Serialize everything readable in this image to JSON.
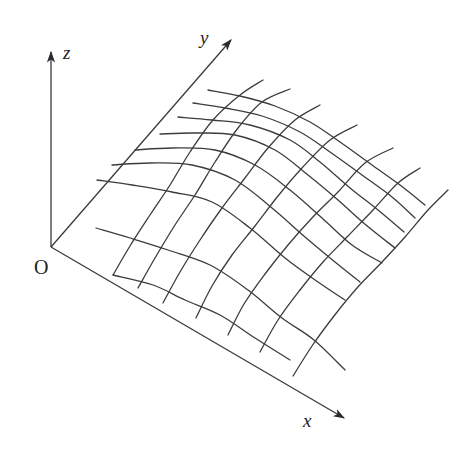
{
  "diagram": {
    "title": "",
    "axes": {
      "origin": {
        "label": "O",
        "pos": [
          51,
          247
        ],
        "label_pos": [
          34,
          257
        ]
      },
      "z": {
        "label": "z",
        "from": [
          51,
          247
        ],
        "to": [
          51,
          52
        ],
        "label_pos": [
          63,
          43
        ]
      },
      "y": {
        "label": "y",
        "from": [
          51,
          247
        ],
        "to": [
          231,
          40
        ],
        "label_pos": [
          200,
          28
        ]
      },
      "x": {
        "label": "x",
        "from": [
          51,
          247
        ],
        "to": [
          344,
          418
        ],
        "label_pos": [
          303,
          411
        ]
      }
    },
    "colors": {
      "line": "#3c3c3c",
      "axis": "#3a3a3a",
      "background": "#ffffff"
    },
    "mesh": {
      "x_lines": [
        [
          [
            208,
            90
          ],
          [
            240,
            96
          ],
          [
            275,
            106
          ],
          [
            310,
            122
          ],
          [
            340,
            142
          ],
          [
            372,
            165
          ],
          [
            400,
            185
          ],
          [
            425,
            205
          ]
        ],
        [
          [
            193,
            103
          ],
          [
            225,
            108
          ],
          [
            262,
            116
          ],
          [
            300,
            132
          ],
          [
            330,
            152
          ],
          [
            362,
            175
          ],
          [
            392,
            197
          ],
          [
            415,
            218
          ]
        ],
        [
          [
            178,
            117
          ],
          [
            212,
            120
          ],
          [
            250,
            125
          ],
          [
            290,
            140
          ],
          [
            320,
            162
          ],
          [
            350,
            188
          ],
          [
            378,
            210
          ],
          [
            404,
            232
          ]
        ],
        [
          [
            160,
            134
          ],
          [
            195,
            133
          ],
          [
            235,
            135
          ],
          [
            275,
            150
          ],
          [
            308,
            175
          ],
          [
            338,
            200
          ],
          [
            366,
            225
          ],
          [
            395,
            248
          ]
        ],
        [
          [
            135,
            150
          ],
          [
            172,
            148
          ],
          [
            215,
            150
          ],
          [
            255,
            165
          ],
          [
            290,
            190
          ],
          [
            322,
            218
          ],
          [
            352,
            245
          ],
          [
            382,
            263
          ]
        ],
        [
          [
            112,
            165
          ],
          [
            150,
            163
          ],
          [
            192,
            165
          ],
          [
            235,
            180
          ],
          [
            272,
            208
          ],
          [
            305,
            237
          ],
          [
            335,
            262
          ],
          [
            360,
            282
          ]
        ],
        [
          [
            97,
            180
          ],
          [
            132,
            185
          ],
          [
            172,
            192
          ],
          [
            212,
            202
          ],
          [
            250,
            228
          ],
          [
            285,
            258
          ],
          [
            318,
            282
          ],
          [
            345,
            300
          ]
        ],
        [
          [
            96,
            228
          ],
          [
            130,
            238
          ],
          [
            168,
            250
          ],
          [
            210,
            265
          ],
          [
            248,
            290
          ],
          [
            282,
            318
          ],
          [
            314,
            340
          ],
          [
            345,
            370
          ]
        ],
        [
          [
            113,
            275
          ],
          [
            153,
            285
          ],
          [
            185,
            300
          ],
          [
            220,
            315
          ],
          [
            255,
            338
          ],
          [
            290,
            360
          ]
        ]
      ],
      "y_lines": [
        [
          [
            113,
            275
          ],
          [
            130,
            246
          ],
          [
            150,
            215
          ],
          [
            170,
            185
          ],
          [
            190,
            152
          ],
          [
            213,
            120
          ],
          [
            240,
            95
          ],
          [
            263,
            80
          ]
        ],
        [
          [
            138,
            288
          ],
          [
            155,
            258
          ],
          [
            175,
            225
          ],
          [
            195,
            195
          ],
          [
            215,
            162
          ],
          [
            238,
            128
          ],
          [
            262,
            102
          ],
          [
            290,
            89
          ]
        ],
        [
          [
            163,
            303
          ],
          [
            180,
            272
          ],
          [
            200,
            240
          ],
          [
            222,
            208
          ],
          [
            245,
            178
          ],
          [
            268,
            148
          ],
          [
            295,
            120
          ],
          [
            320,
            105
          ]
        ],
        [
          [
            196,
            318
          ],
          [
            212,
            286
          ],
          [
            232,
            255
          ],
          [
            255,
            226
          ],
          [
            278,
            196
          ],
          [
            302,
            168
          ],
          [
            330,
            140
          ],
          [
            357,
            125
          ]
        ],
        [
          [
            228,
            335
          ],
          [
            244,
            304
          ],
          [
            265,
            274
          ],
          [
            288,
            245
          ],
          [
            312,
            218
          ],
          [
            338,
            192
          ],
          [
            365,
            163
          ],
          [
            393,
            148
          ]
        ],
        [
          [
            260,
            352
          ],
          [
            278,
            320
          ],
          [
            300,
            290
          ],
          [
            323,
            262
          ],
          [
            348,
            236
          ],
          [
            373,
            210
          ],
          [
            398,
            183
          ],
          [
            420,
            168
          ]
        ],
        [
          [
            293,
            376
          ],
          [
            312,
            346
          ],
          [
            334,
            316
          ],
          [
            357,
            288
          ],
          [
            382,
            262
          ],
          [
            405,
            237
          ],
          [
            428,
            210
          ],
          [
            448,
            190
          ]
        ]
      ]
    }
  }
}
